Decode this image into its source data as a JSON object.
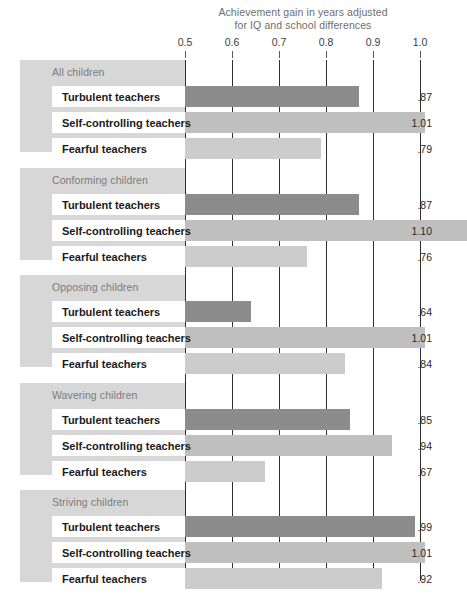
{
  "chart_data": {
    "type": "bar",
    "orientation": "horizontal",
    "title": "Achievement gain in years adjusted for IQ and school differences",
    "title_line1": "Achievement gain in years adjusted",
    "title_line2": "for IQ and school differences",
    "xlabel": "",
    "ylabel": "",
    "xlim": [
      0.5,
      1.0
    ],
    "axis_ticks": [
      "0.5",
      "0.6",
      "0.7",
      "0.8",
      "0.9",
      "1.0"
    ],
    "axis_tick_values": [
      0.5,
      0.6,
      0.7,
      0.8,
      0.9,
      1.0
    ],
    "grid": true,
    "legend_position": "none",
    "series": [
      {
        "name": "Turbulent teachers",
        "key": "turbulent",
        "color": "#8c8c8c"
      },
      {
        "name": "Self-controlling teachers",
        "key": "selfcontrolling",
        "color": "#bfbfbf"
      },
      {
        "name": "Fearful teachers",
        "key": "fearful",
        "color": "#cccccc"
      }
    ],
    "categories": [
      "All children",
      "Conforming children",
      "Opposing children",
      "Wavering children",
      "Striving children"
    ],
    "groups": [
      {
        "title": "All children",
        "rows": [
          {
            "label": "Turbulent teachers",
            "value": 0.87,
            "value_label": ".87",
            "series": "turbulent"
          },
          {
            "label": "Self-controlling teachers",
            "value": 1.01,
            "value_label": "1.01",
            "series": "selfcontrolling"
          },
          {
            "label": "Fearful teachers",
            "value": 0.79,
            "value_label": ".79",
            "series": "fearful"
          }
        ]
      },
      {
        "title": "Conforming children",
        "rows": [
          {
            "label": "Turbulent teachers",
            "value": 0.87,
            "value_label": ".87",
            "series": "turbulent"
          },
          {
            "label": "Self-controlling teachers",
            "value": 1.1,
            "value_label": "1.10",
            "series": "selfcontrolling"
          },
          {
            "label": "Fearful teachers",
            "value": 0.76,
            "value_label": ".76",
            "series": "fearful"
          }
        ]
      },
      {
        "title": "Opposing children",
        "rows": [
          {
            "label": "Turbulent teachers",
            "value": 0.64,
            "value_label": ".64",
            "series": "turbulent"
          },
          {
            "label": "Self-controlling teachers",
            "value": 1.01,
            "value_label": "1.01",
            "series": "selfcontrolling"
          },
          {
            "label": "Fearful teachers",
            "value": 0.84,
            "value_label": ".84",
            "series": "fearful"
          }
        ]
      },
      {
        "title": "Wavering children",
        "rows": [
          {
            "label": "Turbulent teachers",
            "value": 0.85,
            "value_label": ".85",
            "series": "turbulent"
          },
          {
            "label": "Self-controlling teachers",
            "value": 0.94,
            "value_label": ".94",
            "series": "selfcontrolling"
          },
          {
            "label": "Fearful teachers",
            "value": 0.67,
            "value_label": ".67",
            "series": "fearful"
          }
        ]
      },
      {
        "title": "Striving children",
        "rows": [
          {
            "label": "Turbulent teachers",
            "value": 0.99,
            "value_label": ".99",
            "series": "turbulent"
          },
          {
            "label": "Self-controlling teachers",
            "value": 1.01,
            "value_label": "1.01",
            "series": "selfcontrolling"
          },
          {
            "label": "Fearful teachers",
            "value": 0.92,
            "value_label": ".92",
            "series": "fearful"
          }
        ]
      }
    ]
  },
  "layout": {
    "axis_x_start_px": 185,
    "axis_px_per_unit": 470,
    "group_tops_px": [
      0,
      108,
      215,
      323,
      430
    ],
    "group_height_px": 92
  }
}
